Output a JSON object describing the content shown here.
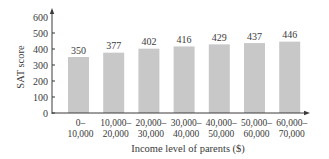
{
  "chart_data": {
    "type": "bar",
    "title": "",
    "xlabel": "Income level of parents ($)",
    "ylabel": "SAT score",
    "ylim": [
      0,
      600
    ],
    "yticks": [
      0,
      100,
      200,
      300,
      400,
      500,
      600
    ],
    "grid": false,
    "legend": null,
    "categories": [
      "0–10,000",
      "10,000–20,000",
      "20,000–30,000",
      "30,000–40,000",
      "40,000–50,000",
      "50,000–60,000",
      "60,000–70,000"
    ],
    "category_lines": [
      [
        "0–",
        "10,000"
      ],
      [
        "10,000–",
        "20,000"
      ],
      [
        "20,000–",
        "30,000"
      ],
      [
        "30,000–",
        "40,000"
      ],
      [
        "40,000–",
        "50,000"
      ],
      [
        "50,000–",
        "60,000"
      ],
      [
        "60,000–",
        "70,000"
      ]
    ],
    "values": [
      350,
      377,
      402,
      416,
      429,
      437,
      446
    ],
    "data_labels": [
      "350",
      "377",
      "402",
      "416",
      "429",
      "437",
      "446"
    ],
    "bar_color": "#c8c8c8",
    "axis_color": "#3a3a3a"
  }
}
